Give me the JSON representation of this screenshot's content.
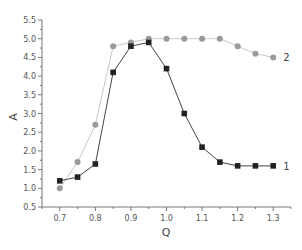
{
  "chart_data": {
    "type": "line",
    "title": "",
    "xlabel": "Q",
    "ylabel": "A",
    "xlim": [
      0.65,
      1.35
    ],
    "ylim": [
      0.5,
      5.5
    ],
    "xticks": [
      0.7,
      0.8,
      0.9,
      1.0,
      1.1,
      1.2,
      1.3
    ],
    "xtick_labels": [
      "0.7",
      "0.8",
      "0.9",
      "1.0",
      "1.1",
      "1.2",
      "1.3"
    ],
    "yticks": [
      0.5,
      1.0,
      1.5,
      2.0,
      2.5,
      3.0,
      3.5,
      4.0,
      4.5,
      5.0,
      5.5
    ],
    "ytick_labels": [
      "0.5",
      "1.0",
      "1.5",
      "2.0",
      "2.5",
      "3.0",
      "3.5",
      "4.0",
      "4.5",
      "5.0",
      "5.5"
    ],
    "grid": false,
    "legend": "inline labels at series ends",
    "x": [
      0.7,
      0.75,
      0.8,
      0.85,
      0.9,
      0.95,
      1.0,
      1.05,
      1.1,
      1.15,
      1.2,
      1.25,
      1.3
    ],
    "series": [
      {
        "name": "1",
        "marker": "square",
        "color": "#222222",
        "line_color": "#444444",
        "values": [
          1.2,
          1.3,
          1.65,
          4.1,
          4.8,
          4.9,
          4.2,
          3.0,
          2.1,
          1.7,
          1.6,
          1.6,
          1.6
        ]
      },
      {
        "name": "2",
        "marker": "circle",
        "color": "#9a9a9a",
        "line_color": "#c8c8c8",
        "values": [
          1.0,
          1.7,
          2.7,
          4.8,
          4.9,
          5.0,
          5.0,
          5.0,
          5.0,
          5.0,
          4.8,
          4.6,
          4.5
        ]
      }
    ]
  }
}
